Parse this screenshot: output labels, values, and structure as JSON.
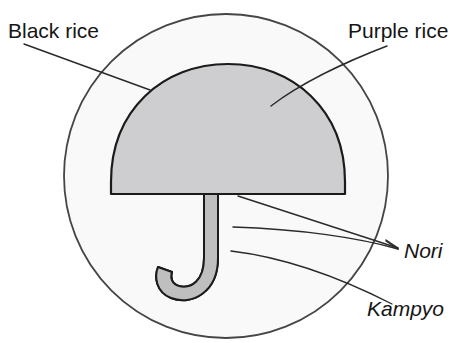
{
  "figure": {
    "background_color": "#ffffff",
    "ink_color": "#2a2a2a",
    "labels": [
      {
        "id": "black-rice",
        "text": "Black rice",
        "style": "regular",
        "x": 8,
        "y": 38,
        "anchor": "start",
        "target_part": "outer-circle"
      },
      {
        "id": "purple-rice",
        "text": "Purple rice",
        "style": "regular",
        "x": 348,
        "y": 38,
        "anchor": "start",
        "target_part": "umbrella-dome"
      },
      {
        "id": "nori",
        "text": "Nori",
        "style": "italic",
        "x": 404,
        "y": 258,
        "anchor": "start",
        "target_part": "umbrella-shaft-and-rim"
      },
      {
        "id": "kampyo",
        "text": "Kampyo",
        "style": "italic",
        "x": 367,
        "y": 316,
        "anchor": "start",
        "target_part": "umbrella-handle-hook"
      }
    ],
    "parts": [
      {
        "id": "outer-circle",
        "name": "Black rice",
        "shape": "circle",
        "center_x": 226,
        "center_y": 176,
        "radius": 162,
        "fill_color": "#f2f2f2",
        "stroke_color": "#3a3a3a"
      },
      {
        "id": "umbrella-dome",
        "name": "Purple rice",
        "shape": "half-dome",
        "left_x": 110,
        "right_x": 345,
        "top_y": 65,
        "baseline_y": 194,
        "fill_color": "#a9a9a9",
        "stroke_color": "#1c1c1c"
      },
      {
        "id": "umbrella-shaft",
        "name": "Nori",
        "shape": "vertical-shaft",
        "left_x": 218,
        "right_x": 232,
        "top_y": 194,
        "bottom_y": 266,
        "fill_color": "#8e8e8e",
        "stroke_color": "#1c1c1c"
      },
      {
        "id": "umbrella-handle-hook",
        "name": "Kampyo",
        "shape": "j-hook",
        "hook_left_x": 175,
        "hook_bottom_y": 300,
        "fill_color": "#8e8e8e",
        "stroke_color": "#1c1c1c"
      }
    ],
    "leader_lines": [
      {
        "id": "leader-black-rice",
        "from_label": "black-rice",
        "path": "M 24 44 L 150 90"
      },
      {
        "id": "leader-purple-rice",
        "from_label": "purple-rice",
        "path": "M 387 46 C 345 62 300 84 271 106"
      },
      {
        "id": "leader-nori-rim",
        "from_label": "nori",
        "path": "M 238 196 L 398 248"
      },
      {
        "id": "leader-nori-shaft",
        "from_label": "nori",
        "path": "M 233 227 C 300 229 360 238 398 249"
      },
      {
        "id": "leader-kampyo",
        "from_label": "kampyo",
        "path": "M 231 251 C 290 258 345 280 392 304"
      }
    ]
  }
}
